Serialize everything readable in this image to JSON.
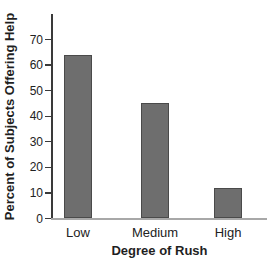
{
  "chart_data": {
    "type": "bar",
    "categories": [
      "Low",
      "Medium",
      "High"
    ],
    "values": [
      64,
      45,
      12
    ],
    "title": "",
    "xlabel": "Degree of Rush",
    "ylabel": "Percent of Subjects Offering Help",
    "ylim": [
      0,
      80
    ],
    "yticks": [
      0,
      10,
      20,
      30,
      40,
      50,
      60,
      70
    ],
    "grid": false,
    "legend": "none",
    "bar_color": "#6e6e6e",
    "bar_border_color": "#4a4a4a",
    "axis_color": "#3a3a3a",
    "baseline_color": "#a8a8a8",
    "text_color": "#222222",
    "background_color": "#ffffff"
  }
}
